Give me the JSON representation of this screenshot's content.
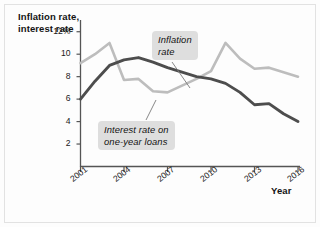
{
  "figure": {
    "y_axis_title": "Inflation rate,\ninterest rate",
    "x_axis_title": "Year"
  },
  "annotations": {
    "inflation": "Inflation\nrate",
    "interest": "Interest rate on\none-year loans"
  },
  "colors": {
    "inflation_line": "#bdbdbd",
    "interest_line": "#4d4d4d",
    "axis": "#555555",
    "callout_bg": "#dedede",
    "text": "#111111",
    "background": "#fdfdfd"
  },
  "chart_data": {
    "type": "line",
    "title": "",
    "xlabel": "Year",
    "ylabel": "Inflation rate, interest rate",
    "x": [
      2001,
      2002,
      2003,
      2004,
      2005,
      2006,
      2007,
      2008,
      2009,
      2010,
      2011,
      2012,
      2013,
      2014,
      2015,
      2016
    ],
    "xtick_labels": [
      "2001",
      "2004",
      "2007",
      "2010",
      "2013",
      "2016"
    ],
    "xtick_values": [
      2001,
      2004,
      2007,
      2010,
      2013,
      2016
    ],
    "ytick_labels": [
      "12%",
      "10",
      "8",
      "6",
      "4",
      "2"
    ],
    "ytick_values": [
      12,
      10,
      8,
      6,
      4,
      2
    ],
    "xlim": [
      2001,
      2016
    ],
    "ylim": [
      0,
      13
    ],
    "grid": false,
    "legend": "inline-callouts",
    "series": [
      {
        "name": "Inflation rate",
        "color": "#bdbdbd",
        "values": [
          9.2,
          10.0,
          11.0,
          7.7,
          7.8,
          6.7,
          6.6,
          7.2,
          7.8,
          8.5,
          11.0,
          9.6,
          8.7,
          8.8,
          8.4,
          8.0
        ]
      },
      {
        "name": "Interest rate on one-year loans",
        "color": "#4d4d4d",
        "values": [
          6.0,
          7.6,
          9.0,
          9.5,
          9.7,
          9.3,
          8.8,
          8.4,
          8.0,
          7.8,
          7.4,
          6.6,
          5.5,
          5.6,
          4.7,
          4.0
        ]
      }
    ]
  }
}
